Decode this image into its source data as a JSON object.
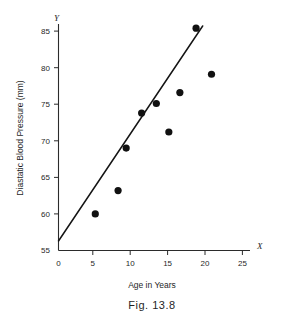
{
  "figure": {
    "caption": "Fig. 13.8",
    "x_axis_letter": "X",
    "y_axis_letter": "Y"
  },
  "chart_data": {
    "type": "scatter",
    "title": "",
    "xlabel": "Age in Years",
    "ylabel": "Diastatic Blood Pressure (mm)",
    "xlim": [
      0,
      26.5
    ],
    "ylim": [
      55,
      86.5
    ],
    "xticks": [
      0,
      5,
      10,
      15,
      20,
      25
    ],
    "xtick_labels": [
      "0",
      "5",
      "10",
      "15",
      "20",
      "25"
    ],
    "yticks": [
      55,
      60,
      65,
      70,
      75,
      80,
      85
    ],
    "ytick_labels": [
      "55",
      "60",
      "65",
      "70",
      "75",
      "80",
      "85"
    ],
    "grid": false,
    "legend": null,
    "point_color": "#111111",
    "line_color": "#151515",
    "axis_color": "#2b2b2b",
    "points": [
      {
        "x": 5.0,
        "y": 60.0
      },
      {
        "x": 8.1,
        "y": 63.2
      },
      {
        "x": 9.2,
        "y": 69.0
      },
      {
        "x": 11.3,
        "y": 73.8
      },
      {
        "x": 13.3,
        "y": 75.1
      },
      {
        "x": 15.0,
        "y": 71.2
      },
      {
        "x": 16.5,
        "y": 76.6
      },
      {
        "x": 18.7,
        "y": 85.4
      },
      {
        "x": 20.8,
        "y": 79.1
      }
    ],
    "fit_line": {
      "x_start": 0.0,
      "y_start": 56.3,
      "x_end": 19.6,
      "y_end": 85.7
    }
  }
}
